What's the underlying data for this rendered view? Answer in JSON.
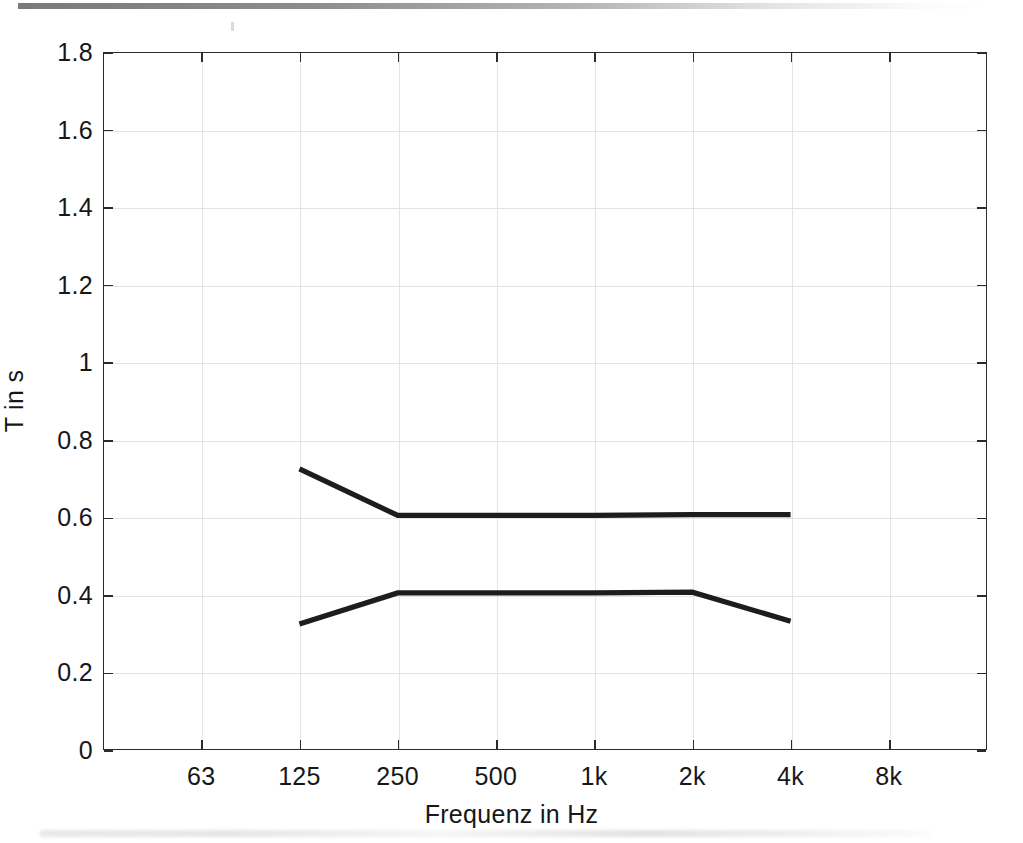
{
  "chart_data": {
    "type": "line",
    "title": "",
    "xlabel": "Frequenz in Hz",
    "ylabel": "T in s",
    "categories": [
      "63",
      "125",
      "250",
      "500",
      "1k",
      "2k",
      "4k",
      "8k"
    ],
    "x_tick_labels": [
      "63",
      "125",
      "250",
      "500",
      "1k",
      "2k",
      "4k",
      "8k"
    ],
    "y_tick_labels": [
      "0",
      "0.2",
      "0.4",
      "0.6",
      "0.8",
      "1",
      "1.2",
      "1.4",
      "1.6",
      "1.8"
    ],
    "y_tick_values": [
      0,
      0.2,
      0.4,
      0.6,
      0.8,
      1,
      1.2,
      1.4,
      1.6,
      1.8
    ],
    "ylim": [
      0,
      1.8
    ],
    "grid": true,
    "legend": "none",
    "line_color": "#1d1d1d",
    "grid_color": "#e4e4e4",
    "axis_color": "#2b2b2b",
    "background_color": "#ffffff",
    "series": [
      {
        "name": "upper-curve",
        "x": [
          "125",
          "250",
          "500",
          "1k",
          "2k",
          "4k"
        ],
        "values": [
          0.725,
          0.605,
          0.605,
          0.605,
          0.607,
          0.607
        ]
      },
      {
        "name": "lower-curve",
        "x": [
          "125",
          "250",
          "500",
          "1k",
          "2k",
          "4k"
        ],
        "values": [
          0.325,
          0.405,
          0.405,
          0.405,
          0.407,
          0.332
        ]
      }
    ]
  },
  "artifacts": {
    "top_scan_bar": "scan-edge-shadow",
    "bottom_smudge": "scan-edge-smudge"
  }
}
